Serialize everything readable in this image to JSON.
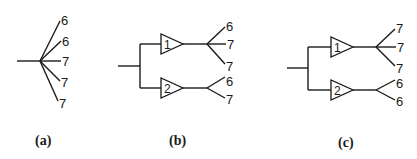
{
  "figure": {
    "panels": [
      {
        "id": "a",
        "caption": "(a)",
        "leaves": [
          "6",
          "6",
          "7",
          "7",
          "7"
        ]
      },
      {
        "id": "b",
        "caption": "(b)",
        "groups": [
          {
            "node_label": "1",
            "leaves": [
              "6",
              "7",
              "7"
            ]
          },
          {
            "node_label": "2",
            "leaves": [
              "6",
              "7"
            ]
          }
        ]
      },
      {
        "id": "c",
        "caption": "(c)",
        "groups": [
          {
            "node_label": "1",
            "leaves": [
              "7",
              "7",
              "7"
            ]
          },
          {
            "node_label": "2",
            "leaves": [
              "6",
              "6"
            ]
          }
        ]
      }
    ]
  }
}
